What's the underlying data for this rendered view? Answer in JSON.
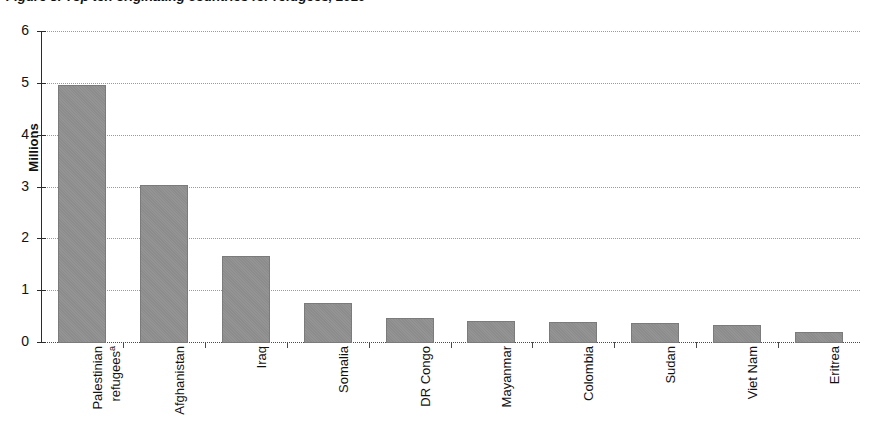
{
  "chart_data": {
    "type": "bar",
    "title": "Figure 3. Top ten originating countries for refugees, 2010",
    "xlabel": "",
    "ylabel": "Millions",
    "ylim": [
      0,
      6
    ],
    "yticks": [
      "0",
      "1",
      "2",
      "3",
      "4",
      "5",
      "6"
    ],
    "grid": true,
    "legend": "none",
    "orientation": "vertical",
    "bar_color": "#8c8c8c",
    "categories": [
      "Palestinian refugees",
      "Afghanistan",
      "Iraq",
      "Somalia",
      "DR Congo",
      "Mayanmar",
      "Colombia",
      "Sudan",
      "Viet Nam",
      "Eritrea"
    ],
    "category_labels": [
      {
        "line1": "Palestinian",
        "line2": "refugees",
        "footnote": "a"
      },
      {
        "line1": "Afghanistan",
        "line2": "",
        "footnote": ""
      },
      {
        "line1": "Iraq",
        "line2": "",
        "footnote": ""
      },
      {
        "line1": "Somalia",
        "line2": "",
        "footnote": ""
      },
      {
        "line1": "DR Congo",
        "line2": "",
        "footnote": ""
      },
      {
        "line1": "Mayanmar",
        "line2": "",
        "footnote": ""
      },
      {
        "line1": "Colombia",
        "line2": "",
        "footnote": ""
      },
      {
        "line1": "Sudan",
        "line2": "",
        "footnote": ""
      },
      {
        "line1": "Viet Nam",
        "line2": "",
        "footnote": ""
      },
      {
        "line1": "Eritrea",
        "line2": "",
        "footnote": ""
      }
    ],
    "values": [
      4.98,
      3.05,
      1.68,
      0.78,
      0.48,
      0.42,
      0.4,
      0.39,
      0.34,
      0.22
    ],
    "value_units": "millions"
  }
}
